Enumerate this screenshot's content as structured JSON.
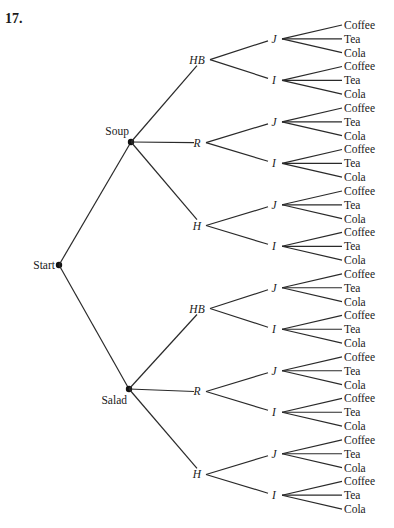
{
  "problem_number": "17.",
  "tree": {
    "root": {
      "label": "Start",
      "x": 59,
      "y": 265
    },
    "level1": [
      {
        "label": "Soup",
        "x": 131,
        "y": 142
      },
      {
        "label": "Salad",
        "x": 129,
        "y": 389
      }
    ],
    "level2_labels": [
      "HB",
      "R",
      "H"
    ],
    "level3_labels": [
      "J",
      "I"
    ],
    "leaf_labels": [
      "Coffee",
      "Tea",
      "Cola"
    ],
    "leaf_top_y": 25,
    "leaf_spacing": 13.83,
    "leaf_x": 344,
    "level3_x": 276,
    "level2_x": 200
  }
}
